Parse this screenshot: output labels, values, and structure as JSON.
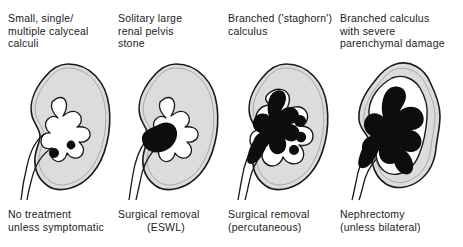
{
  "figure": {
    "background_color": "#ffffff",
    "ink_color": "#1a1a1a",
    "parenchyma_color": "#dcdcdc",
    "calculus_color": "#0d0d0d"
  },
  "columns": [
    {
      "id": "small-multiple-calyceal-calculi",
      "header_line1": "Small, single/",
      "header_line2": "multiple calyceal",
      "header_line3": "calculi",
      "caption_line1": "No treatment",
      "caption_line2": "unless symptomatic",
      "stone_description": "two small round calculi in lower calyces",
      "stone_count": 2
    },
    {
      "id": "solitary-large-renal-pelvis-stone",
      "header_line1": "Solitary large",
      "header_line2": "renal pelvis",
      "header_line3": "stone",
      "caption_line1": "Surgical removal",
      "caption_line2": "(ESWL)",
      "stone_description": "single large oval stone filling renal pelvis",
      "stone_count": 1
    },
    {
      "id": "branched-staghorn-calculus",
      "header_line1": "Branched ('staghorn')",
      "header_line2": "calculus",
      "header_line3": "",
      "caption_line1": "Surgical removal",
      "caption_line2": "(percutaneous)",
      "stone_description": "branched staghorn calculus with three satellite calyceal stones",
      "stone_count": 4
    },
    {
      "id": "branched-calculus-severe-parenchymal-damage",
      "header_line1": "Branched calculus",
      "header_line2": "with severe",
      "header_line3": "parenchymal damage",
      "caption_line1": "Nephrectomy",
      "caption_line2": "(unless bilateral)",
      "stone_description": "massive branched calculus with thinned, scarred parenchyma",
      "stone_count": 1
    }
  ]
}
